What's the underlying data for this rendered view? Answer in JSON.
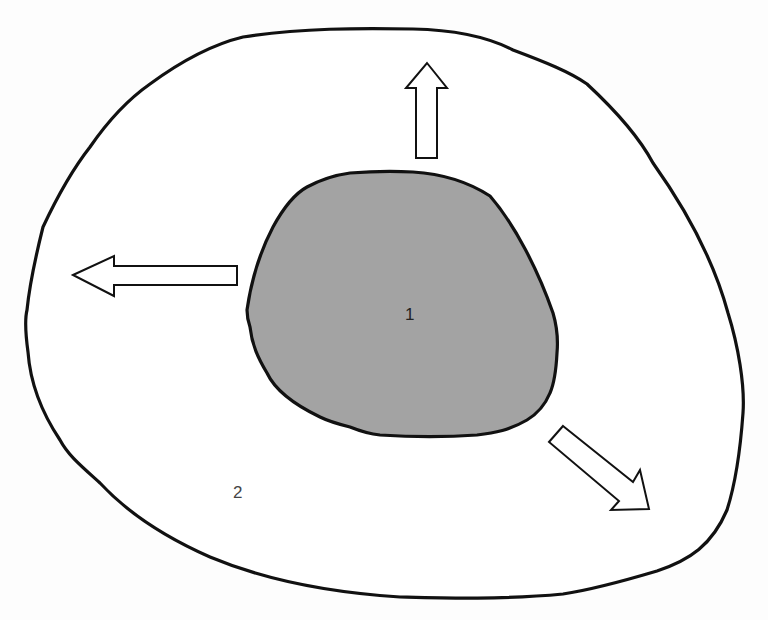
{
  "diagram": {
    "regions": [
      {
        "id": "inner",
        "label": "1",
        "fill": "#a3a3a3",
        "stroke": "#111111"
      },
      {
        "id": "outer",
        "label": "2",
        "fill": "#ffffff",
        "stroke": "#111111"
      }
    ],
    "arrows": [
      {
        "direction": "up",
        "style": "hollow"
      },
      {
        "direction": "left",
        "style": "hollow"
      },
      {
        "direction": "down-right",
        "style": "hollow"
      }
    ]
  },
  "labels": {
    "inner": "1",
    "outer": "2"
  },
  "colors": {
    "background": "#fdfdfd",
    "inner_fill": "#a3a3a3",
    "outline": "#111111",
    "arrow_fill": "#ffffff"
  }
}
